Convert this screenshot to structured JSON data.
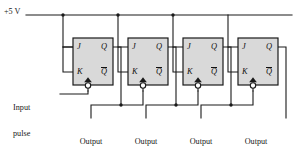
{
  "figure": {
    "supply_label": "+5 V",
    "input_label_lines": [
      "Input",
      "pulse",
      "train"
    ],
    "input_label": "Input pulse train"
  },
  "colors": {
    "background": "#ffffff",
    "wire": "#1a1a1a",
    "block_fill": "#d9d9d9",
    "block_stroke": "#1a1a1a",
    "text": "#1a1a1a",
    "bubble_fill": "#ffffff"
  },
  "ports": {
    "j": "J",
    "k": "K",
    "q": "Q",
    "qbar": "Q"
  },
  "flipflops": [
    {
      "name": "flip-flop-1",
      "x": 73,
      "y": 38,
      "w": 40,
      "h": 47,
      "ports": {
        "j": "J",
        "k": "K",
        "q": "Q",
        "qbar": "Q"
      }
    },
    {
      "name": "flip-flop-2",
      "x": 128,
      "y": 38,
      "w": 40,
      "h": 47,
      "ports": {
        "j": "J",
        "k": "K",
        "q": "Q",
        "qbar": "Q"
      }
    },
    {
      "name": "flip-flop-3",
      "x": 183,
      "y": 38,
      "w": 40,
      "h": 47,
      "ports": {
        "j": "J",
        "k": "K",
        "q": "Q",
        "qbar": "Q"
      }
    },
    {
      "name": "flip-flop-4",
      "x": 238,
      "y": 38,
      "w": 40,
      "h": 47,
      "ports": {
        "j": "J",
        "k": "K",
        "q": "Q",
        "qbar": "Q"
      }
    }
  ],
  "outputs": [
    {
      "name": "output-1",
      "line1": "Output",
      "line2": "# 1",
      "x": 91
    },
    {
      "name": "output-2",
      "line1": "Output",
      "line2": "# 2",
      "x": 146
    },
    {
      "name": "output-3",
      "line1": "Output",
      "line2": "# 3",
      "x": 201
    },
    {
      "name": "output-4",
      "line1": "Output",
      "line2": "# 4",
      "x": 256
    }
  ]
}
